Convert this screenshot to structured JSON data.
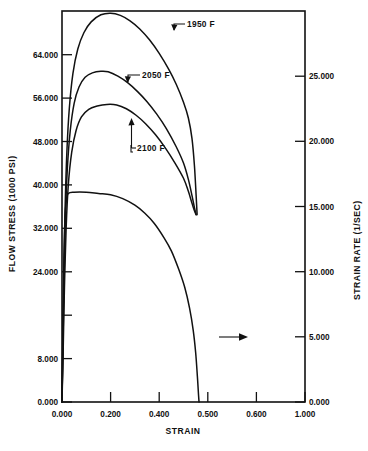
{
  "chart_data": {
    "type": "line",
    "title": "",
    "xlabel": "STRAIN",
    "ylabel": "FLOW STRESS (1000 PSI)",
    "y2label": "STRAIN RATE (1/SEC)",
    "xlim": [
      0.0,
      1.0
    ],
    "ylim": [
      0.0,
      72.0
    ],
    "y2lim": [
      0.0,
      30.0
    ],
    "grid": false,
    "legend_position": "inline-annotations",
    "x_ticks": [
      "0.000",
      "0.200",
      "0.400",
      "0.500",
      "0.600",
      "1.000"
    ],
    "x_tick_values": [
      0.0,
      0.2,
      0.4,
      0.5,
      0.6,
      1.0
    ],
    "y_ticks": [
      "0.000",
      "8.000",
      "16.000",
      "24.000",
      "32.000",
      "40.000",
      "48.000",
      "56.000",
      "64.000"
    ],
    "y_tick_labels_shown": [
      "0.000",
      "8.000",
      "24.000",
      "32.000",
      "40.000",
      "48.000",
      "56.000",
      "64.000"
    ],
    "y2_ticks": [
      "0.000",
      "5.000",
      "10.000",
      "15.000",
      "20.000",
      "25.000"
    ],
    "y2_tick_values": [
      0.0,
      5.0,
      10.0,
      15.0,
      20.0,
      25.0
    ],
    "annotations": [
      {
        "text": "1950 F",
        "x": 0.42,
        "y": 69.0
      },
      {
        "text": "2050 F",
        "x": 0.31,
        "y": 61.5
      },
      {
        "text": "2100 F",
        "x": 0.26,
        "y": 50.5
      },
      {
        "text": "strain-rate-arrow",
        "x": 0.6,
        "y": 12.5
      }
    ],
    "series": [
      {
        "name": "1950 F",
        "axis": "left",
        "units": "1000 PSI",
        "points": [
          [
            0.0,
            0.0
          ],
          [
            0.004,
            12.0
          ],
          [
            0.008,
            24.0
          ],
          [
            0.013,
            36.0
          ],
          [
            0.02,
            46.0
          ],
          [
            0.03,
            54.0
          ],
          [
            0.045,
            60.5
          ],
          [
            0.065,
            65.0
          ],
          [
            0.09,
            68.0
          ],
          [
            0.12,
            70.0
          ],
          [
            0.16,
            71.3
          ],
          [
            0.2,
            71.6
          ],
          [
            0.24,
            71.2
          ],
          [
            0.28,
            70.2
          ],
          [
            0.32,
            68.7
          ],
          [
            0.36,
            66.7
          ],
          [
            0.4,
            64.2
          ],
          [
            0.44,
            61.2
          ],
          [
            0.47,
            58.5
          ],
          [
            0.5,
            55.2
          ],
          [
            0.52,
            52.3
          ],
          [
            0.535,
            48.5
          ],
          [
            0.545,
            43.5
          ],
          [
            0.552,
            38.0
          ],
          [
            0.556,
            34.5
          ]
        ]
      },
      {
        "name": "2050 F",
        "axis": "left",
        "units": "1000 PSI",
        "points": [
          [
            0.0,
            0.0
          ],
          [
            0.004,
            11.0
          ],
          [
            0.009,
            23.0
          ],
          [
            0.014,
            34.0
          ],
          [
            0.022,
            43.0
          ],
          [
            0.034,
            50.0
          ],
          [
            0.05,
            55.0
          ],
          [
            0.07,
            58.0
          ],
          [
            0.095,
            59.8
          ],
          [
            0.125,
            60.6
          ],
          [
            0.16,
            60.9
          ],
          [
            0.19,
            60.8
          ],
          [
            0.23,
            60.0
          ],
          [
            0.27,
            58.8
          ],
          [
            0.31,
            57.2
          ],
          [
            0.35,
            55.3
          ],
          [
            0.39,
            53.0
          ],
          [
            0.43,
            50.3
          ],
          [
            0.47,
            47.0
          ],
          [
            0.5,
            44.0
          ],
          [
            0.52,
            41.0
          ],
          [
            0.535,
            38.0
          ],
          [
            0.545,
            35.8
          ],
          [
            0.552,
            34.5
          ]
        ]
      },
      {
        "name": "2100 F",
        "axis": "left",
        "units": "1000 PSI",
        "points": [
          [
            0.0,
            0.0
          ],
          [
            0.005,
            10.0
          ],
          [
            0.01,
            21.0
          ],
          [
            0.017,
            32.0
          ],
          [
            0.026,
            40.0
          ],
          [
            0.04,
            46.0
          ],
          [
            0.058,
            50.0
          ],
          [
            0.08,
            52.5
          ],
          [
            0.11,
            53.9
          ],
          [
            0.145,
            54.5
          ],
          [
            0.185,
            54.8
          ],
          [
            0.225,
            54.7
          ],
          [
            0.265,
            54.0
          ],
          [
            0.305,
            52.8
          ],
          [
            0.345,
            51.2
          ],
          [
            0.385,
            49.2
          ],
          [
            0.425,
            46.8
          ],
          [
            0.465,
            44.0
          ],
          [
            0.5,
            41.2
          ],
          [
            0.52,
            38.8
          ],
          [
            0.535,
            36.6
          ],
          [
            0.545,
            35.2
          ],
          [
            0.552,
            34.5
          ]
        ]
      },
      {
        "name": "STRAIN RATE",
        "axis": "right",
        "units": "1/SEC",
        "points": [
          [
            0.0,
            0.0
          ],
          [
            0.004,
            6.0
          ],
          [
            0.008,
            11.0
          ],
          [
            0.012,
            14.0
          ],
          [
            0.018,
            15.5
          ],
          [
            0.026,
            16.0
          ],
          [
            0.05,
            16.1
          ],
          [
            0.1,
            16.1
          ],
          [
            0.15,
            16.0
          ],
          [
            0.2,
            15.9
          ],
          [
            0.25,
            15.6
          ],
          [
            0.3,
            15.1
          ],
          [
            0.34,
            14.5
          ],
          [
            0.38,
            13.7
          ],
          [
            0.42,
            12.6
          ],
          [
            0.45,
            11.6
          ],
          [
            0.48,
            10.2
          ],
          [
            0.505,
            8.8
          ],
          [
            0.525,
            7.2
          ],
          [
            0.54,
            5.5
          ],
          [
            0.55,
            3.8
          ],
          [
            0.557,
            2.0
          ],
          [
            0.562,
            0.5
          ],
          [
            0.564,
            0.0
          ]
        ]
      }
    ]
  },
  "axes": {
    "left_title": "FLOW STRESS (1000 PSI)",
    "right_title": "STRAIN RATE (1/SEC)",
    "bottom_title": "STRAIN"
  },
  "labels": {
    "y_0": "0.000",
    "y_8": "8.000",
    "y_24": "24.000",
    "y_32": "32.000",
    "y_40": "40.000",
    "y_48": "48.000",
    "y_56": "56.000",
    "y_64": "64.000",
    "x_0": "0.000",
    "x_1": "0.200",
    "x_2": "0.400",
    "x_3": "0.500",
    "x_4": "0.600",
    "x_5": "1.000",
    "r_0": "0.000",
    "r_5": "5.000",
    "r_10": "10.000",
    "r_15": "15.000",
    "r_20": "20.000",
    "r_25": "25.000",
    "s_1950": "1950 F",
    "s_2050": "2050 F",
    "s_2100": "2100 F"
  }
}
